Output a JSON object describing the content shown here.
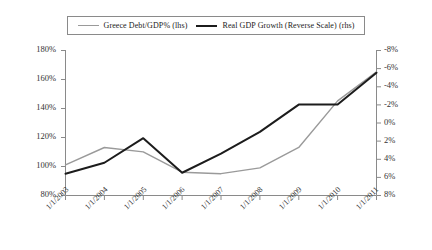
{
  "chart_data": {
    "type": "line",
    "title": "",
    "subtitle": "",
    "xlabel": "",
    "ylabel": "",
    "grid": false,
    "legend_position": "top-center",
    "x": [
      "1/1/2003",
      "1/1/2004",
      "1/1/2005",
      "1/1/2006",
      "1/1/2007",
      "1/1/2008",
      "1/1/2009",
      "1/1/2010",
      "1/1/2011"
    ],
    "axes": {
      "left": {
        "label": "",
        "ticks": [
          "80%",
          "100%",
          "120%",
          "140%",
          "160%",
          "180%"
        ],
        "tick_values": [
          80,
          100,
          120,
          140,
          160,
          180
        ],
        "ylim": [
          80,
          180
        ],
        "units": "percent of GDP"
      },
      "right": {
        "label": "",
        "ticks": [
          "8%",
          "6%",
          "4%",
          "2%",
          "0%",
          "-2%",
          "-4%",
          "-6%",
          "-8%"
        ],
        "tick_values": [
          8,
          6,
          4,
          2,
          0,
          -2,
          -4,
          -6,
          -8
        ],
        "ylim": [
          8,
          -8
        ],
        "reversed": true,
        "units": "percent"
      }
    },
    "series": [
      {
        "name": "Greece Debt/GDP% (lhs)",
        "axis": "left",
        "color": "#9a9a9a",
        "width": 1.4,
        "values": [
          101,
          113,
          110,
          96,
          95,
          99,
          113,
          145,
          165
        ]
      },
      {
        "name": "Real GDP Growth (Reverse Scale) (rhs)",
        "axis": "right",
        "color": "#1c1c1c",
        "width": 2.0,
        "values": [
          5.6,
          4.4,
          1.7,
          5.5,
          3.4,
          1.0,
          -2.0,
          -2.0,
          -5.5
        ]
      }
    ]
  },
  "legend": {
    "entries": [
      {
        "label": "Greece Debt/GDP% (lhs)",
        "style": "light"
      },
      {
        "label": "Real GDP Growth (Reverse Scale) (rhs)",
        "style": "dark"
      }
    ]
  },
  "axis_left": {
    "t0": "80%",
    "t1": "100%",
    "t2": "120%",
    "t3": "140%",
    "t4": "160%",
    "t5": "180%"
  },
  "axis_right": {
    "t0": "8%",
    "t1": "6%",
    "t2": "4%",
    "t3": "2%",
    "t4": "0%",
    "t5": "-2%",
    "t6": "-4%",
    "t7": "-6%",
    "t8": "-8%"
  },
  "axis_x": {
    "t0": "1/1/2003",
    "t1": "1/1/2004",
    "t2": "1/1/2005",
    "t3": "1/1/2006",
    "t4": "1/1/2007",
    "t5": "1/1/2008",
    "t6": "1/1/2009",
    "t7": "1/1/2010",
    "t8": "1/1/2011"
  },
  "colors": {
    "series_light": "#9a9a9a",
    "series_dark": "#1c1c1c",
    "axis": "#8a8a8a",
    "text": "#333333",
    "background": "#ffffff"
  }
}
